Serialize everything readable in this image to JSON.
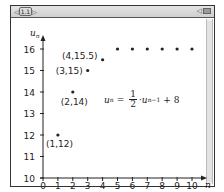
{
  "window": {
    "tab_label": "1.1",
    "tab_prev_icon": "left-arrow-icon",
    "tab_next_icon": "right-arrow-icon",
    "status_icons": [
      "speaker-icon",
      "battery-icon"
    ]
  },
  "formula": {
    "lhs_var": "u",
    "lhs_sub": "n",
    "equals": "=",
    "frac_num": "1",
    "frac_den": "2",
    "dot": "·",
    "rhs_var": "u",
    "rhs_sub": "n−1",
    "plus_const": "+ 8"
  },
  "chart_data": {
    "type": "scatter",
    "title": "",
    "xlabel": "n",
    "ylabel": "u_n",
    "xlim": [
      0,
      10
    ],
    "ylim": [
      10,
      16
    ],
    "x_ticks": [
      0,
      1,
      2,
      3,
      4,
      5,
      6,
      7,
      8,
      9,
      10
    ],
    "y_ticks": [
      10,
      11,
      12,
      13,
      14,
      15,
      16
    ],
    "grid": false,
    "x": [
      1,
      2,
      3,
      4,
      5,
      6,
      7,
      8,
      9,
      10
    ],
    "values": [
      12,
      14,
      15,
      15.5,
      16,
      16,
      16,
      16,
      16,
      16
    ],
    "annotations": [
      {
        "x": 1,
        "y": 12,
        "text": "(1,12)"
      },
      {
        "x": 2,
        "y": 14,
        "text": "(2,14)"
      },
      {
        "x": 3,
        "y": 15,
        "text": "(3,15)"
      },
      {
        "x": 4,
        "y": 15.5,
        "text": "(4,15.5)"
      }
    ],
    "formula_text": "u_n = 1/2 · u_{n−1} + 8"
  }
}
